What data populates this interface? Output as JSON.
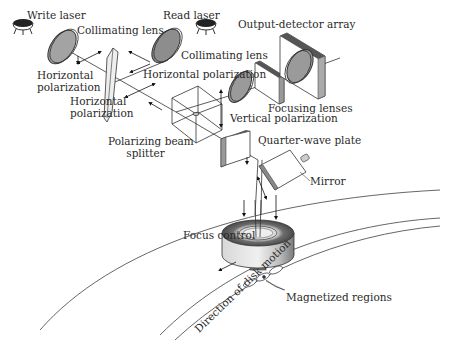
{
  "diagram": {
    "type": "optical-system-schematic",
    "labels": {
      "write_laser": "Write laser",
      "read_laser": "Read laser",
      "collimating_lens_1": "Collimating lens",
      "collimating_lens_2": "Collimating lens",
      "output_detector_array": "Output-detector array",
      "horizontal_polarization_1": "Horizontal polarization",
      "horizontal_polarization_2": "Horizontal polarization",
      "horizontal_polarization_3": "Horizontal polarization",
      "focusing_lenses": "Focusing lenses",
      "vertical_polarization": "Vertical polarization",
      "polarizing_beam_splitter": "Polarizing beam splitter",
      "quarter_wave_plate": "Quarter-wave plate",
      "mirror": "Mirror",
      "focus_control": "Focus control",
      "direction_of_disk_motion": "Direction of disk motion",
      "magnetized_regions": "Magnetized regions"
    },
    "label_lines": {
      "horiz_pol_left_l1": "Horizontal",
      "horiz_pol_left_l2": "polarization",
      "horiz_pol_mid_l1": "Horizontal",
      "horiz_pol_mid_l2": "polarization",
      "pbs_l1": "Polarizing beam",
      "pbs_l2": "splitter",
      "collimating_right": "Collimating lens",
      "horiz_pol_right": "Horizontal polarization"
    },
    "colors": {
      "line": "#333333",
      "lens_fill": "#9a9a9a",
      "plate_edge": "#555555",
      "disk_line": "#555555",
      "background": "#ffffff"
    }
  }
}
